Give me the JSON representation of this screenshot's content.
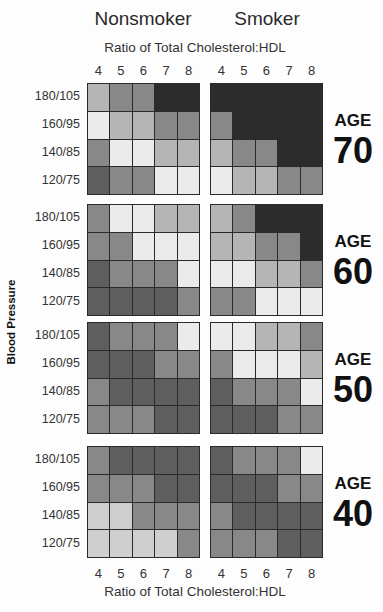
{
  "chart_data": {
    "type": "heatmap",
    "title": "",
    "column_groups": [
      "Nonsmoker",
      "Smoker"
    ],
    "xlabel": "Ratio of Total Cholesterol:HDL",
    "x_ticks": [
      "4",
      "5",
      "6",
      "7",
      "8"
    ],
    "ylabel": "Blood Pressure",
    "y_ticks": [
      "180/105",
      "160/95",
      "140/85",
      "120/75"
    ],
    "row_groups": [
      "AGE 70",
      "AGE 60",
      "AGE 50",
      "AGE 40"
    ],
    "value_scale": "shade level 1 (lightest) to 5 (darkest)",
    "legend": "none shown",
    "panels": [
      {
        "age": "70",
        "group": "Nonsmoker",
        "values": [
          [
            2,
            3,
            3,
            5,
            5
          ],
          [
            1,
            2,
            2,
            3,
            3
          ],
          [
            3,
            1,
            1,
            2,
            2
          ],
          [
            4,
            3,
            3,
            1,
            1
          ]
        ]
      },
      {
        "age": "70",
        "group": "Smoker",
        "values": [
          [
            5,
            5,
            5,
            5,
            5
          ],
          [
            3,
            5,
            5,
            5,
            5
          ],
          [
            2,
            3,
            3,
            5,
            5
          ],
          [
            1,
            2,
            2,
            3,
            3
          ]
        ]
      },
      {
        "age": "60",
        "group": "Nonsmoker",
        "values": [
          [
            3,
            1,
            1,
            2,
            2
          ],
          [
            3,
            3,
            1,
            1,
            1
          ],
          [
            4,
            3,
            3,
            3,
            1
          ],
          [
            4,
            4,
            4,
            4,
            3
          ]
        ]
      },
      {
        "age": "60",
        "group": "Smoker",
        "values": [
          [
            2,
            3,
            5,
            5,
            5
          ],
          [
            2,
            2,
            3,
            3,
            5
          ],
          [
            1,
            1,
            2,
            2,
            3
          ],
          [
            3,
            3,
            1,
            1,
            1
          ]
        ]
      },
      {
        "age": "50",
        "group": "Nonsmoker",
        "values": [
          [
            4,
            3,
            3,
            3,
            1
          ],
          [
            4,
            4,
            4,
            3,
            3
          ],
          [
            3,
            4,
            4,
            4,
            4
          ],
          [
            3,
            3,
            3,
            4,
            4
          ]
        ]
      },
      {
        "age": "50",
        "group": "Smoker",
        "values": [
          [
            1,
            1,
            2,
            2,
            3
          ],
          [
            3,
            1,
            1,
            1,
            2
          ],
          [
            4,
            3,
            3,
            3,
            1
          ],
          [
            4,
            4,
            4,
            3,
            3
          ]
        ]
      },
      {
        "age": "40",
        "group": "Nonsmoker",
        "values": [
          [
            3,
            4,
            4,
            4,
            4
          ],
          [
            3,
            3,
            3,
            4,
            4
          ],
          [
            1.5,
            1.5,
            3,
            3,
            3
          ],
          [
            1.5,
            1.5,
            1.5,
            1.5,
            3
          ]
        ]
      },
      {
        "age": "40",
        "group": "Smoker",
        "values": [
          [
            4,
            3,
            3,
            3,
            1
          ],
          [
            4,
            4,
            4,
            3,
            3
          ],
          [
            3,
            4,
            4,
            4,
            4
          ],
          [
            3,
            3,
            3,
            4,
            4
          ]
        ]
      }
    ]
  },
  "labels": {
    "nonsmoker": "Nonsmoker",
    "smoker": "Smoker",
    "x_title_top": "Ratio of Total Cholesterol:HDL",
    "x_title_bottom": "Ratio of Total Cholesterol:HDL",
    "y_title": "Blood Pressure",
    "age_word": "AGE",
    "ages": [
      "70",
      "60",
      "50",
      "40"
    ]
  },
  "shades": {
    "1": "#ebebeb",
    "1.5": "#cfcfcf",
    "2": "#b5b5b5",
    "3": "#888888",
    "4": "#5e5e5e",
    "5": "#2c2c2c"
  }
}
